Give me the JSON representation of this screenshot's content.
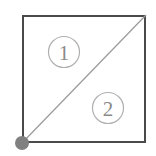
{
  "figure": {
    "canvas": {
      "width": 156,
      "height": 156,
      "background": "#ffffff"
    },
    "square": {
      "name": "square-outline",
      "x": 22,
      "y": 15,
      "width": 124,
      "height": 128,
      "stroke_color": "#4a4a4a",
      "stroke_width": 2,
      "fill": "none"
    },
    "diagonal": {
      "name": "diagonal-line",
      "from": {
        "x": 22,
        "y": 143
      },
      "to": {
        "x": 146,
        "y": 15
      },
      "stroke_color": "#9a9a9a",
      "stroke_width": 1.2
    },
    "vertex_dot": {
      "name": "vertex-dot",
      "cx": 22,
      "cy": 143,
      "r": 7,
      "fill_color": "#808080"
    },
    "region_labels": [
      {
        "name": "region-label-1",
        "text": "1",
        "cx": 64,
        "cy": 52,
        "r": 15.5,
        "circle_stroke": "#b0b0b0",
        "circle_stroke_width": 1.2,
        "text_color": "#8a8a8a"
      },
      {
        "name": "region-label-2",
        "text": "2",
        "cx": 108,
        "cy": 108,
        "r": 15.5,
        "circle_stroke": "#b0b0b0",
        "circle_stroke_width": 1.2,
        "text_color": "#8a8a8a"
      }
    ]
  }
}
